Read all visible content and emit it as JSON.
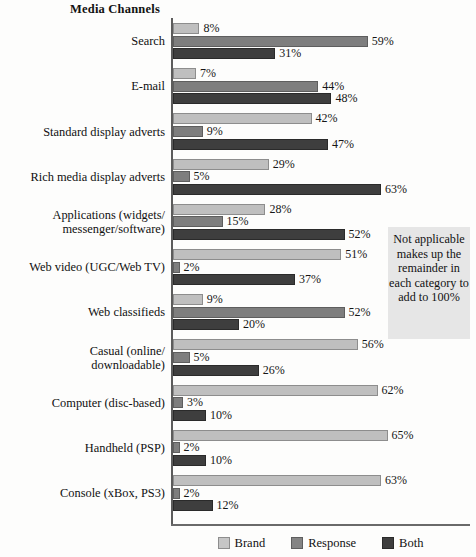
{
  "chart_data": {
    "type": "bar",
    "orientation": "horizontal",
    "title": "Media Channels",
    "xlabel": "",
    "ylabel": "",
    "xlim": [
      0,
      70
    ],
    "grid": false,
    "legend_position": "bottom-center",
    "value_suffix": "%",
    "categories": [
      "Search",
      "E-mail",
      "Standard display adverts",
      "Rich media display adverts",
      "Applications (widgets/\nmessenger/software)",
      "Web video (UGC/Web TV)",
      "Web classifieds",
      "Casual (online/\ndownloadable)",
      "Computer (disc-based)",
      "Handheld (PSP)",
      "Console (xBox, PS3)"
    ],
    "series": [
      {
        "name": "Brand",
        "color": "#bfbfbf",
        "values": [
          8,
          7,
          42,
          29,
          28,
          51,
          9,
          56,
          62,
          65,
          63
        ],
        "labels": [
          "8%",
          "7%",
          "42%",
          "29%",
          "28%",
          "51%",
          "9%",
          "56%",
          "62%",
          "65%",
          "63%"
        ]
      },
      {
        "name": "Response",
        "color": "#7e7e7e",
        "values": [
          59,
          44,
          9,
          5,
          15,
          2,
          52,
          5,
          3,
          2,
          2
        ],
        "labels": [
          "59%",
          "44%",
          "9%",
          "5%",
          "15%",
          "2%",
          "52%",
          "5%",
          "3%",
          "2%",
          "2%"
        ]
      },
      {
        "name": "Both",
        "color": "#3e3e3e",
        "values": [
          31,
          48,
          47,
          63,
          52,
          37,
          20,
          26,
          10,
          10,
          12
        ],
        "labels": [
          "31%",
          "48%",
          "47%",
          "63%",
          "52%",
          "37%",
          "20%",
          "26%",
          "10%",
          "10%",
          "12%"
        ]
      }
    ],
    "annotation": "Not applicable makes up the remainder in each category to add to 100%"
  },
  "legend": {
    "items": [
      {
        "label": "Brand",
        "swatch": "series-brand"
      },
      {
        "label": "Response",
        "swatch": "series-response"
      },
      {
        "label": "Both",
        "swatch": "series-both"
      }
    ]
  }
}
